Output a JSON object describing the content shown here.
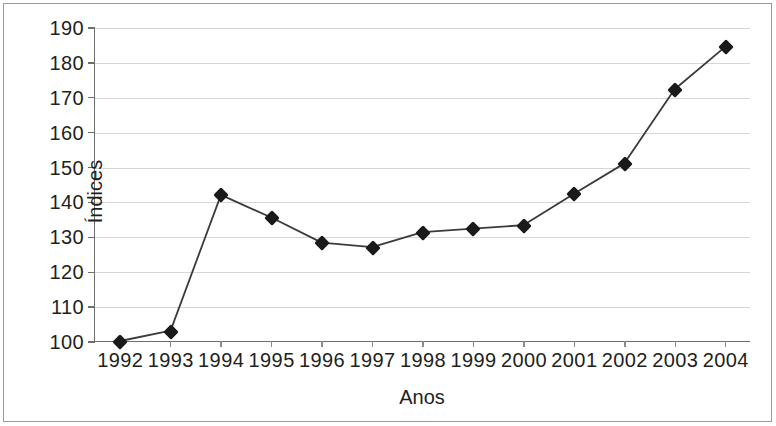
{
  "chart_data": {
    "type": "line",
    "title": "",
    "xlabel": "Anos",
    "ylabel": "Índices",
    "categories": [
      "1992",
      "1993",
      "1994",
      "1995",
      "1996",
      "1997",
      "1998",
      "1999",
      "2000",
      "2001",
      "2002",
      "2003",
      "2004"
    ],
    "values": [
      100,
      103,
      142,
      135.5,
      128.3,
      127,
      131.3,
      132.3,
      133.3,
      142.3,
      151,
      172.3,
      184.5
    ],
    "series": [
      {
        "name": "Índices",
        "values": [
          100,
          103,
          142,
          135.5,
          128.3,
          127,
          131.3,
          132.3,
          133.3,
          142.3,
          151,
          172.3,
          184.5
        ]
      }
    ],
    "ylim": [
      100,
      190
    ],
    "yticks": [
      100,
      110,
      120,
      130,
      140,
      150,
      160,
      170,
      180,
      190
    ],
    "ytick_labels": [
      "100",
      "110",
      "120",
      "130",
      "140",
      "150",
      "160",
      "170",
      "180",
      "190"
    ],
    "xtick_labels": [
      "1992",
      "1993",
      "1994",
      "1995",
      "1996",
      "1997",
      "1998",
      "1999",
      "2000",
      "2001",
      "2002",
      "2003",
      "2004"
    ],
    "grid": true,
    "grid_axis": "y",
    "legend": false,
    "legend_position": "none",
    "marker": "diamond",
    "line_color": "#3b3b3b",
    "marker_color": "#1a1a1a",
    "grid_color": "#d6d6d6",
    "axis_color": "#6e6e6e",
    "background_color": "#ffffff",
    "text_color": "#231f20"
  }
}
